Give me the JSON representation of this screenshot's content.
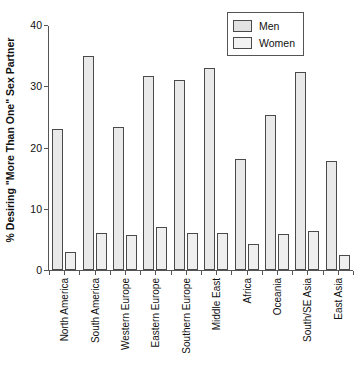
{
  "chart_data": {
    "type": "bar",
    "title": "",
    "xlabel": "",
    "ylabel": "% Desiring \"More Than One\" Sex Partner",
    "ylim": [
      0,
      40
    ],
    "yticks": [
      0,
      10,
      20,
      30,
      40
    ],
    "ytick_labels": [
      "0",
      "10",
      "20",
      "30",
      "40"
    ],
    "grid": false,
    "legend_position": "top-right",
    "categories": [
      "North America",
      "South America",
      "Western Europe",
      "Eastern Europe",
      "Southern Europe",
      "Middle East",
      "Africa",
      "Oceania",
      "South/SE Asia",
      "East Asia"
    ],
    "series": [
      {
        "name": "Men",
        "color": "#e9e9e9",
        "values": [
          23.0,
          35.0,
          23.3,
          31.6,
          31.0,
          33.0,
          18.2,
          25.3,
          32.3,
          17.8
        ]
      },
      {
        "name": "Women",
        "color": "#efefef",
        "values": [
          3.0,
          6.1,
          5.7,
          7.0,
          6.0,
          6.0,
          4.2,
          5.8,
          6.3,
          2.5
        ]
      }
    ]
  },
  "legend": {
    "items": [
      {
        "label": "Men"
      },
      {
        "label": "Women"
      }
    ]
  },
  "colors": {
    "axis": "#555555",
    "bar_border": "#4a4a4a",
    "men_fill": "#e9e9e9",
    "women_fill": "#efefef",
    "background": "#ffffff",
    "text": "#111111"
  }
}
